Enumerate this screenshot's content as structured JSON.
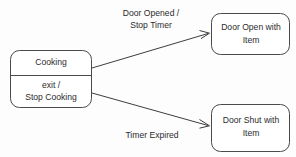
{
  "diagram": {
    "type": "uml-state-machine-diagram",
    "background_color": "#fdfdfd",
    "line_color": "#3d3d3d",
    "text_color": "#2b2b2b",
    "states": [
      {
        "id": "cooking",
        "name": "Cooking",
        "activity_line_1": "exit /",
        "activity_line_2": "Stop Cooking",
        "has_divider": true,
        "x": 10,
        "y": 50,
        "width": 82,
        "height": 58,
        "divider_y": 75,
        "radius": 9
      },
      {
        "id": "door-open-with-item",
        "name_line_1": "Door Open with",
        "name_line_2": "Item",
        "has_divider": false,
        "x": 211,
        "y": 13,
        "width": 79,
        "height": 42,
        "radius": 9
      },
      {
        "id": "door-shut-with-item",
        "name_line_1": "Door Shut with",
        "name_line_2": "Item",
        "has_divider": false,
        "x": 211,
        "y": 104,
        "width": 79,
        "height": 48,
        "radius": 9
      }
    ],
    "transitions": [
      {
        "id": "cooking-to-door-open",
        "from": "cooking",
        "to": "door-open-with-item",
        "label_line_1": "Door Opened /",
        "label_line_2": "Stop Timer",
        "label_x": 151,
        "label_y_1": 14,
        "label_y_2": 26,
        "x1": 92,
        "y1": 68,
        "x2": 210,
        "y2": 33
      },
      {
        "id": "cooking-to-door-shut",
        "from": "cooking",
        "to": "door-shut-with-item",
        "label_line_1": "Timer Expired",
        "label_line_2": "",
        "label_x": 152,
        "label_y_1": 136,
        "label_y_2": null,
        "x1": 92,
        "y1": 93,
        "x2": 210,
        "y2": 126
      }
    ]
  }
}
